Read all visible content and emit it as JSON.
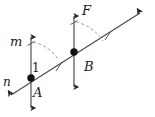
{
  "figure": {
    "type": "geometry-diagram",
    "background_color": "#ffffff",
    "stroke_color": "#3c3c3c",
    "label_color": "#1a1a1a",
    "labels": {
      "line_m": "m",
      "line_n": "n",
      "line_f": "F",
      "point_a": "A",
      "point_b": "B",
      "angle_one": "1"
    },
    "points": [
      {
        "name": "A",
        "x": 31,
        "y": 78
      },
      {
        "name": "B",
        "x": 74,
        "y": 52
      }
    ],
    "lines": [
      {
        "name": "m",
        "kind": "vertical-double-arrow",
        "x": 31,
        "y_top": 31,
        "y_bottom": 114,
        "tick_marks": 1
      },
      {
        "name": "F",
        "kind": "vertical-double-arrow",
        "x": 74,
        "y_top": 10,
        "y_bottom": 93,
        "tick_marks": 1
      },
      {
        "name": "n",
        "kind": "transversal-double-arrow",
        "x1": 6,
        "y1": 99,
        "x2": 145,
        "y2": 10,
        "tick_marks": 2
      }
    ],
    "angle_arcs": [
      {
        "at": "A",
        "style": "dashed",
        "from": "line-m-top",
        "to": "transversal"
      },
      {
        "at": "B",
        "style": "dashed",
        "from": "line-F-top",
        "to": "transversal"
      }
    ]
  }
}
